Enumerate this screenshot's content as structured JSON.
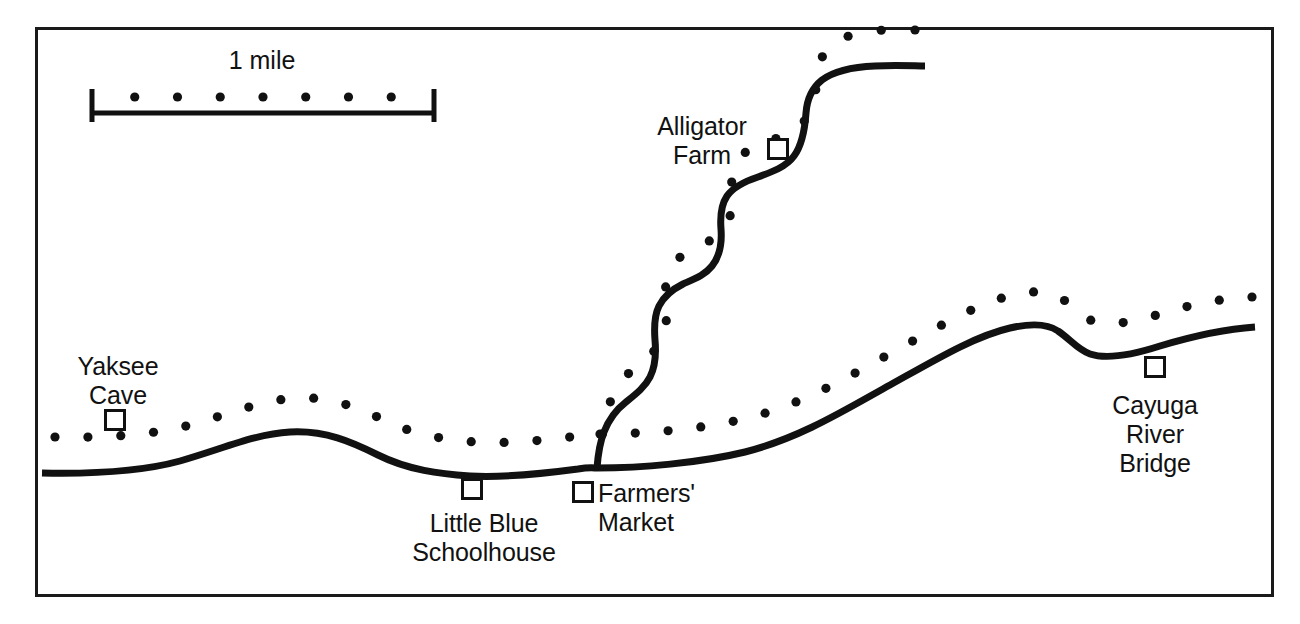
{
  "figure": {
    "kind": "terrain-profile-map",
    "background_color": "#ffffff",
    "ink_color": "#111111",
    "border": {
      "color": "#1a1a1a",
      "width_px": 3
    }
  },
  "scale_bar": {
    "label": "1 mile",
    "label_x": 262,
    "label_y": 46,
    "bar_left_x": 92,
    "bar_right_x": 434,
    "bar_y": 113,
    "cap_top_y": 89,
    "cap_bottom_y": 122,
    "dot_y": 97,
    "dot_count": 7,
    "dot_radius": 4.6
  },
  "markers": [
    {
      "name": "yaksee-cave",
      "x": 115,
      "y": 420,
      "size": 19
    },
    {
      "name": "little-blue-schoolhouse",
      "x": 472,
      "y": 489,
      "size": 19
    },
    {
      "name": "farmers-market",
      "x": 583,
      "y": 492,
      "size": 19
    },
    {
      "name": "alligator-farm",
      "x": 778,
      "y": 149,
      "size": 19
    },
    {
      "name": "cayuga-river-bridge",
      "x": 1155,
      "y": 367,
      "size": 19
    }
  ],
  "labels": [
    {
      "name": "yaksee-cave",
      "lines": [
        "Yaksee",
        "Cave"
      ],
      "text": "Yaksee\nCave",
      "x": 118,
      "y": 352,
      "align": "center"
    },
    {
      "name": "little-blue-schoolhouse",
      "lines": [
        "Little Blue",
        "Schoolhouse"
      ],
      "text": "Little Blue\nSchoolhouse",
      "x": 484,
      "y": 509,
      "align": "center"
    },
    {
      "name": "farmers-market",
      "lines": [
        "Farmers'",
        "Market"
      ],
      "text": "Farmers'\nMarket",
      "x": 598,
      "y": 479,
      "align": "left"
    },
    {
      "name": "alligator-farm",
      "lines": [
        "Alligator",
        "Farm"
      ],
      "text": "Alligator\nFarm",
      "x": 702,
      "y": 112,
      "align": "center"
    },
    {
      "name": "cayuga-river-bridge",
      "lines": [
        "Cayuga",
        "River",
        "Bridge"
      ],
      "text": "Cayuga\nRiver\nBridge",
      "x": 1155,
      "y": 391,
      "align": "center"
    }
  ],
  "roads": [
    {
      "name": "main-valley-road",
      "stroke_width": 7,
      "path": "M 42 473 C 90 474 140 472 180 461 C 225 448 255 434 290 432 C 325 430 352 442 378 455 C 408 470 440 474 470 476 C 505 478 548 473 578 469 C 590 467 594 468 597 468 C 640 468 700 463 745 452 C 800 438 845 410 890 385 C 935 360 975 336 1010 328 C 1032 323 1048 324 1058 331 C 1070 339 1078 350 1090 354 C 1108 360 1135 354 1160 346 C 1190 337 1225 329 1255 327"
    },
    {
      "name": "alligator-farm-switchback-road",
      "stroke_width": 7,
      "path": "M 597 468 C 598 455 600 442 604 432 C 609 419 617 409 626 402 C 636 394 645 387 650 377 C 656 365 656 351 655 340 C 654 327 654 316 659 306 C 664 296 673 289 683 284 C 694 279 705 275 712 266 C 720 256 722 242 721 229 C 720 216 721 205 727 196 C 734 186 746 181 758 177 C 772 172 786 167 794 156 C 803 144 805 127 806 113 C 807 99 812 88 822 80 C 834 71 853 67 875 66 C 897 65 915 66 925 66"
    }
  ],
  "dotted_trails": [
    {
      "name": "main-valley-trail-dotted",
      "dot_radius": 4.6,
      "path": "M 55 437 C 100 438 148 436 190 425 C 233 413 262 400 297 398 C 330 396 358 408 384 420 C 414 435 446 440 475 442 C 510 444 548 440 578 436 C 590 434 596 434 600 434 C 645 434 704 429 748 418 C 803 404 848 377 893 352 C 938 327 978 303 1013 295 C 1035 290 1051 291 1061 298 C 1073 306 1081 317 1093 321 C 1111 327 1138 321 1163 313 C 1193 304 1225 298 1252 297"
    },
    {
      "name": "alligator-farm-trail-dotted",
      "dot_radius": 4.6,
      "path": "M 600 434 C 604 420 608 406 613 396 C 619 383 628 373 637 366 C 647 358 656 351 661 341 C 667 329 667 315 666 304 C 665 291 665 280 670 270 C 675 260 684 253 694 248 C 705 243 716 239 723 230 C 731 220 733 206 732 193 C 731 180 732 169 738 160 C 745 150 757 145 769 141 C 783 136 797 131 805 120 C 814 108 816 91 817 77 C 818 63 823 52 833 44 C 845 35 864 31 886 30 C 898 30 908 30 915 30"
    }
  ]
}
